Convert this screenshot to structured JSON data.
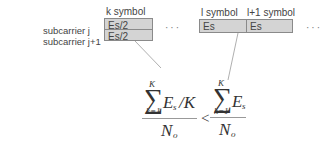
{
  "rows": {
    "row1_label": "subcarrier j",
    "row2_label": "subcarrier j+1"
  },
  "k_block": {
    "header": "k symbol",
    "cells": [
      "Es/2",
      "Es/2"
    ]
  },
  "l_block": {
    "headers": [
      "l symbol",
      "l+1 symbol"
    ],
    "cells": [
      "Es",
      "Es"
    ]
  },
  "ellipsis": {
    "left": "···",
    "right": "···"
  },
  "formula": {
    "left": {
      "sum_upper": "K",
      "sum_lower": "k=1",
      "sum_symbol": "∑",
      "term": "E",
      "term_sub": "s",
      "divisor": "/K",
      "denominator": "N",
      "denominator_sub": "o"
    },
    "relation": "<",
    "right": {
      "sum_upper": "K",
      "sum_lower": "k=1",
      "sum_symbol": "∑",
      "term": "E",
      "term_sub": "s",
      "denominator": "N",
      "denominator_sub": "o"
    }
  },
  "colors": {
    "cell_fill": "#d4d4d4",
    "cell_border": "#8a8a8a",
    "connector": "#9a9a9a"
  }
}
